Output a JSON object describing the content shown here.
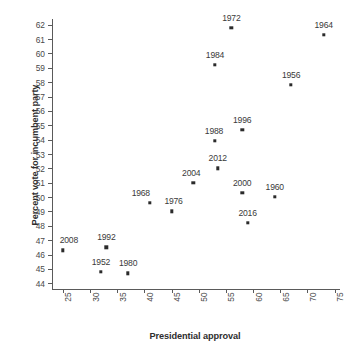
{
  "chart_data": {
    "type": "scatter",
    "title": "",
    "xlabel": "Presidential approval",
    "ylabel": "Percent vote for incumbent party",
    "xlim": [
      23,
      76
    ],
    "ylim": [
      43.6,
      62.4
    ],
    "xticks": [
      25,
      30,
      35,
      40,
      45,
      50,
      55,
      60,
      65,
      70,
      75
    ],
    "yticks": [
      44,
      45,
      46,
      47,
      48,
      49,
      50,
      51,
      52,
      53,
      54,
      55,
      56,
      57,
      58,
      59,
      60,
      61,
      62
    ],
    "grid": false,
    "legend": false,
    "point_color": "#2b2b2b",
    "axis_color": "#5a5a5a",
    "points": [
      {
        "label": "1952",
        "x": 32.0,
        "y": 44.8
      },
      {
        "label": "1956",
        "x": 67.0,
        "y": 57.8
      },
      {
        "label": "1960",
        "x": 64.0,
        "y": 50.0
      },
      {
        "label": "1964",
        "x": 73.0,
        "y": 61.3
      },
      {
        "label": "1968",
        "x": 41.0,
        "y": 49.6
      },
      {
        "label": "1972",
        "x": 56.0,
        "y": 61.8
      },
      {
        "label": "1976",
        "x": 45.0,
        "y": 49.0
      },
      {
        "label": "1980",
        "x": 37.0,
        "y": 44.7
      },
      {
        "label": "1984",
        "x": 53.0,
        "y": 59.2
      },
      {
        "label": "1988",
        "x": 53.0,
        "y": 53.9
      },
      {
        "label": "1992",
        "x": 33.0,
        "y": 46.5
      },
      {
        "label": "1996",
        "x": 58.0,
        "y": 54.7
      },
      {
        "label": "2000",
        "x": 58.0,
        "y": 50.3
      },
      {
        "label": "2004",
        "x": 49.0,
        "y": 51.0
      },
      {
        "label": "2008",
        "x": 25.0,
        "y": 46.3
      },
      {
        "label": "2012",
        "x": 53.5,
        "y": 52.0
      },
      {
        "label": "2016",
        "x": 59.0,
        "y": 48.2
      }
    ],
    "label_offsets": {
      "1952": {
        "dx": 0,
        "dy": -5
      },
      "1956": {
        "dx": 0,
        "dy": -5
      },
      "1960": {
        "dx": 0,
        "dy": -5
      },
      "1964": {
        "dx": 0,
        "dy": -5
      },
      "1968": {
        "dx": -9,
        "dy": -5
      },
      "1972": {
        "dx": 0,
        "dy": -5
      },
      "1976": {
        "dx": 2,
        "dy": -5
      },
      "1980": {
        "dx": 0,
        "dy": -5
      },
      "1984": {
        "dx": 0,
        "dy": -5
      },
      "1988": {
        "dx": -1,
        "dy": -5
      },
      "1992": {
        "dx": 0,
        "dy": -5
      },
      "1996": {
        "dx": 0,
        "dy": -5
      },
      "2000": {
        "dx": 0,
        "dy": -5
      },
      "2004": {
        "dx": -2,
        "dy": -5
      },
      "2008": {
        "dx": 6,
        "dy": -5
      },
      "2012": {
        "dx": 0,
        "dy": -5
      },
      "2016": {
        "dx": 0,
        "dy": -5
      }
    }
  }
}
